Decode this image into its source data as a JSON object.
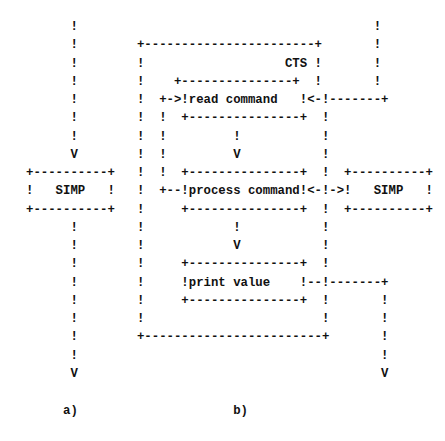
{
  "figure": {
    "panel_a_label": "a)",
    "panel_b_label": "b)",
    "left_module": "SIMP",
    "right_module": "SIMP",
    "container_label": "CTS",
    "steps": [
      "read command",
      "process command",
      "print value"
    ]
  },
  "ascii_rows": [
    "      !                                        !",
    "      !        +-----------------------+       !",
    "      !        !                   CTS !       !",
    "      !        !    +---------------+  !       !",
    "      !        !  +->!read command   !<-!-------+",
    "      !        !  !  +---------------+  !",
    "      !        !  !         !           !",
    "      V        !  !         V           !",
    "+----------+   !  !  +---------------+  !  +----------+",
    "!   SIMP   !   !  +--!process command!<-!->!   SIMP   !",
    "+----------+   !     +---------------+  !  +----------+",
    "      !        !            !           !",
    "      !        !            V           !",
    "      !        !     +---------------+  !",
    "      !        !     !print value    !--!-------+",
    "      !        !     +---------------+  !       !",
    "      !        !                        !       !",
    "      !        +------------------------+       !",
    "      !                                         !",
    "      V                                         V",
    "",
    "     a)                     b)"
  ]
}
